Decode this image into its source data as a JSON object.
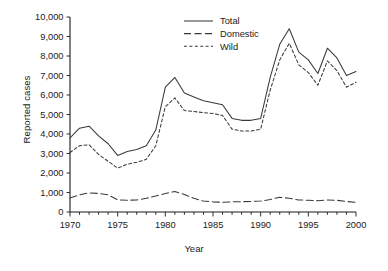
{
  "chart_data": {
    "type": "line",
    "title": "",
    "xlabel": "Year",
    "ylabel": "Reported cases",
    "xlim": [
      1970,
      2000
    ],
    "ylim": [
      0,
      10000
    ],
    "grid": false,
    "legend_position": "top-center",
    "ytick_labels": [
      "0",
      "1,000",
      "2,000",
      "3,000",
      "4,000",
      "5,000",
      "6,000",
      "7,000",
      "8,000",
      "9,000",
      "10,000"
    ],
    "ytick_values": [
      0,
      1000,
      2000,
      3000,
      4000,
      5000,
      6000,
      7000,
      8000,
      9000,
      10000
    ],
    "xtick_labels": [
      "1970",
      "1975",
      "1980",
      "1985",
      "1990",
      "1995",
      "2000"
    ],
    "xtick_values": [
      1970,
      1975,
      1980,
      1985,
      1990,
      1995,
      2000
    ],
    "x": [
      1970,
      1971,
      1972,
      1973,
      1974,
      1975,
      1976,
      1977,
      1978,
      1979,
      1980,
      1981,
      1982,
      1983,
      1984,
      1985,
      1986,
      1987,
      1988,
      1989,
      1990,
      1991,
      1992,
      1993,
      1994,
      1995,
      1996,
      1997,
      1998,
      1999,
      2000
    ],
    "series": [
      {
        "name": "Total",
        "style": "solid",
        "values": [
          3800,
          4300,
          4400,
          3900,
          3500,
          2900,
          3100,
          3200,
          3400,
          4200,
          6400,
          6900,
          6100,
          5900,
          5700,
          5600,
          5500,
          4800,
          4700,
          4700,
          4800,
          6900,
          8600,
          9400,
          8200,
          7800,
          7100,
          8400,
          7900,
          7000,
          7200
        ]
      },
      {
        "name": "Domestic",
        "style": "long-dash",
        "values": [
          720,
          880,
          980,
          950,
          880,
          620,
          600,
          620,
          700,
          820,
          950,
          1050,
          900,
          700,
          560,
          520,
          500,
          520,
          530,
          540,
          560,
          640,
          760,
          700,
          620,
          600,
          580,
          620,
          600,
          540,
          500
        ]
      },
      {
        "name": "Wild",
        "style": "short-dash",
        "values": [
          3050,
          3400,
          3450,
          2950,
          2600,
          2250,
          2450,
          2550,
          2700,
          3400,
          5400,
          5850,
          5200,
          5150,
          5100,
          5050,
          4950,
          4250,
          4150,
          4150,
          4250,
          6250,
          7800,
          8650,
          7550,
          7150,
          6500,
          7750,
          7250,
          6400,
          6650
        ]
      }
    ]
  },
  "legend": {
    "items": [
      {
        "label": "Total"
      },
      {
        "label": "Domestic"
      },
      {
        "label": "Wild"
      }
    ]
  }
}
